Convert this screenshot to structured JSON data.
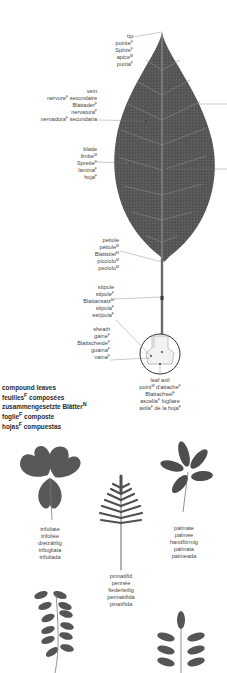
{
  "diagram": {
    "colors": {
      "leaf": "#555555",
      "vein": "#9a9a9a",
      "leader": "#777777",
      "text": "#444444"
    },
    "labels": {
      "tip": {
        "en": "tip",
        "fr": "pointe",
        "fr_g": "F",
        "de": "Spitze",
        "de_g": "F",
        "it": "apice",
        "it_g": "M",
        "es": "punta",
        "es_g": "F"
      },
      "vein": {
        "en": "vein",
        "fr": "nervure",
        "fr_g": "F",
        "fr2": "secondaire",
        "de": "Blattader",
        "de_g": "F",
        "it": "nervatura",
        "it_g": "F",
        "es": "nervadura",
        "es_g": "F",
        "es2": "secundaria"
      },
      "blade": {
        "en": "blade",
        "fr": "limbe",
        "fr_g": "M",
        "de": "Spreite",
        "de_g": "F",
        "it": "lamina",
        "it_g": "F",
        "es": "hoja",
        "es_g": "F"
      },
      "petiole": {
        "en": "petiole",
        "fr": "pétiole",
        "fr_g": "M",
        "de": "Blattstiel",
        "de_g": "M",
        "it": "picciolo",
        "it_g": "M",
        "es": "peciolo",
        "es_g": "M"
      },
      "stipule": {
        "en": "stipule",
        "fr": "stipule",
        "fr_g": "F",
        "de": "Blattansatz",
        "de_g": "M",
        "it": "stipola",
        "it_g": "F",
        "es": "estípula",
        "es_g": "F"
      },
      "sheath": {
        "en": "sheath",
        "fr": "gaine",
        "fr_g": "F",
        "de": "Blattscheide",
        "de_g": "F",
        "it": "guaina",
        "it_g": "F",
        "es": "vaina",
        "es_g": "F"
      },
      "leaf_axil": {
        "en": "leaf axil",
        "fr": "point",
        "fr_g": "M",
        "fr2": "d'attache",
        "fr2_g": "F",
        "de": "Blattachsel",
        "de_g": "F",
        "it": "ascella",
        "it_g": "F",
        "it2": "fogliare",
        "es": "axila",
        "es_g": "F",
        "es2": "de la hoja",
        "es2_g": "F"
      }
    },
    "compound": {
      "title_en": "compound leaves",
      "title_fr": "feuilles",
      "title_fr_g": "F",
      "title_fr2": "composées",
      "title_de": "zusammengesetzte Blätter",
      "title_de_g": "N",
      "title_it": "foglie",
      "title_it_g": "F",
      "title_it2": "composte",
      "title_es": "hojas",
      "title_es_g": "F",
      "title_es2": "compuestas",
      "types": [
        {
          "en": "trifoliate",
          "fr": "trifoliée",
          "de": "dreizählig",
          "it": "trifogliata",
          "es": "trifoliada"
        },
        {
          "en": "pinnatifid",
          "fr": "pennée",
          "de": "fiederteilig",
          "it": "pennatifida",
          "es": "pinatífida"
        },
        {
          "en": "palmate",
          "fr": "palmée",
          "de": "handförmig",
          "it": "palmata",
          "es": "palmeada"
        }
      ]
    }
  }
}
